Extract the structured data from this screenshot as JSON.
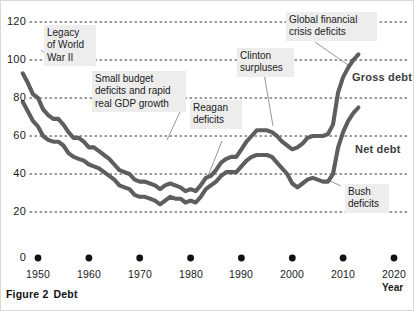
{
  "figure": {
    "caption_number": "Figure 2",
    "caption_text": "Debt"
  },
  "chart_data": {
    "type": "line",
    "title": "",
    "xlabel": "Year",
    "ylabel": "",
    "xlim": [
      1946,
      2022
    ],
    "ylim": [
      0,
      125
    ],
    "grid": true,
    "grid_style": "dotted-horizontal",
    "legend": "inline-labels",
    "y_ticks": [
      0,
      20,
      40,
      60,
      80,
      100,
      120
    ],
    "x_ticks": [
      1950,
      1960,
      1970,
      1980,
      1990,
      2000,
      2010,
      2020
    ],
    "x_tick_marker": "filled-circle",
    "series": [
      {
        "name": "Gross debt",
        "color": "#5e5e5e",
        "x": [
          1947,
          1948,
          1949,
          1950,
          1951,
          1952,
          1953,
          1954,
          1955,
          1956,
          1957,
          1958,
          1959,
          1960,
          1961,
          1962,
          1963,
          1964,
          1965,
          1966,
          1967,
          1968,
          1969,
          1970,
          1971,
          1972,
          1973,
          1974,
          1975,
          1976,
          1977,
          1978,
          1979,
          1980,
          1981,
          1982,
          1983,
          1984,
          1985,
          1986,
          1987,
          1988,
          1989,
          1990,
          1991,
          1992,
          1993,
          1994,
          1995,
          1996,
          1997,
          1998,
          1999,
          2000,
          2001,
          2002,
          2003,
          2004,
          2005,
          2006,
          2007,
          2008,
          2009,
          2010,
          2011,
          2012,
          2013
        ],
        "values": [
          93,
          88,
          82,
          80,
          74,
          71,
          69,
          69,
          66,
          62,
          59,
          59,
          57,
          54,
          54,
          52,
          50,
          48,
          45,
          42,
          41,
          40,
          37,
          36,
          36,
          35,
          34,
          32,
          34,
          35,
          34,
          33,
          31,
          32,
          31,
          34,
          38,
          39,
          42,
          46,
          48,
          49,
          49,
          53,
          57,
          60,
          63,
          63,
          63,
          62,
          60,
          57,
          55,
          53,
          54,
          56,
          59,
          60,
          60,
          60,
          61,
          66,
          83,
          91,
          96,
          100,
          103
        ]
      },
      {
        "name": "Net debt",
        "color": "#5e5e5e",
        "x": [
          1947,
          1948,
          1949,
          1950,
          1951,
          1952,
          1953,
          1954,
          1955,
          1956,
          1957,
          1958,
          1959,
          1960,
          1961,
          1962,
          1963,
          1964,
          1965,
          1966,
          1967,
          1968,
          1969,
          1970,
          1971,
          1972,
          1973,
          1974,
          1975,
          1976,
          1977,
          1978,
          1979,
          1980,
          1981,
          1982,
          1983,
          1984,
          1985,
          1986,
          1987,
          1988,
          1989,
          1990,
          1991,
          1992,
          1993,
          1994,
          1995,
          1996,
          1997,
          1998,
          1999,
          2000,
          2001,
          2002,
          2003,
          2004,
          2005,
          2006,
          2007,
          2008,
          2009,
          2010,
          2011,
          2012,
          2013
        ],
        "values": [
          78,
          73,
          68,
          65,
          60,
          58,
          57,
          57,
          55,
          51,
          49,
          48,
          47,
          45,
          44,
          43,
          41,
          39,
          37,
          34,
          33,
          32,
          29,
          28,
          28,
          27,
          26,
          24,
          26,
          28,
          27,
          27,
          25,
          26,
          25,
          28,
          32,
          34,
          36,
          39,
          41,
          41,
          41,
          44,
          47,
          49,
          50,
          50,
          50,
          49,
          46,
          43,
          40,
          35,
          33,
          35,
          37,
          38,
          37,
          36,
          36,
          40,
          54,
          62,
          68,
          72,
          75
        ]
      }
    ],
    "series_labels": [
      {
        "text": "Gross debt"
      },
      {
        "text": "Net debt"
      }
    ],
    "annotations": [
      {
        "id": "legacy-wwii",
        "text": "Legacy\nof World\nWar II"
      },
      {
        "id": "small-budget-deficits",
        "text": "Small budget\ndeficits and rapid\nreal GDP growth"
      },
      {
        "id": "reagan-deficits",
        "text": "Reagan\ndeficits"
      },
      {
        "id": "clinton-surpluses",
        "text": "Clinton\nsurpluses"
      },
      {
        "id": "global-financial-crisis-deficits",
        "text": "Global financial\ncrisis deficits"
      },
      {
        "id": "bush-deficits",
        "text": "Bush\ndeficits"
      }
    ]
  }
}
